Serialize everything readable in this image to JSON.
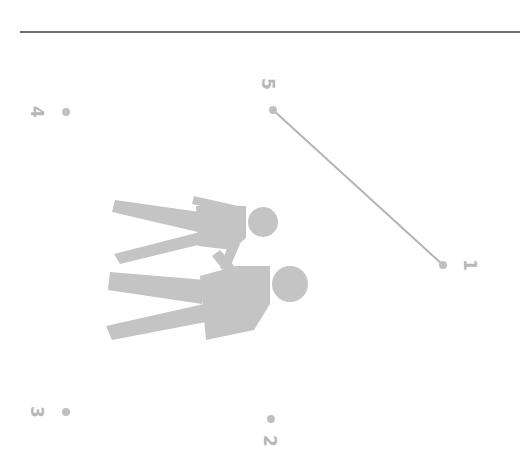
{
  "diagram": {
    "orientation": "rotated 90deg clockwise",
    "figure": "two-people-holding-hands",
    "colors": {
      "figure": "#c4c4c4",
      "dot": "#c0c0c0",
      "line": "#b4b4b4",
      "label": "#b8b8b8",
      "rule": "#6e6e6e"
    },
    "points": [
      {
        "label": "1",
        "x": 443,
        "y": 265
      },
      {
        "label": "2",
        "x": 271,
        "y": 419
      },
      {
        "label": "3",
        "x": 66,
        "y": 412
      },
      {
        "label": "4",
        "x": 66,
        "y": 112
      },
      {
        "label": "5",
        "x": 273,
        "y": 110
      }
    ],
    "connections": [
      {
        "from": "5",
        "to": "1"
      }
    ]
  }
}
